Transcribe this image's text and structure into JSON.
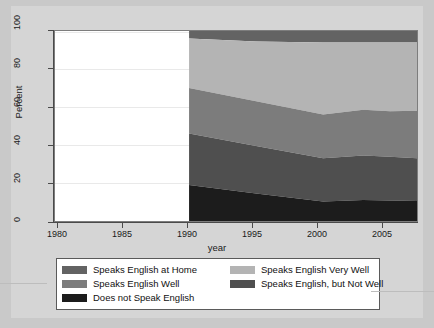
{
  "chart_data": {
    "type": "area",
    "title": "",
    "subtitle": "",
    "xlabel": "year",
    "ylabel": "Percent",
    "xlim": [
      1980,
      2007
    ],
    "ylim": [
      0,
      100
    ],
    "grid": true,
    "legend_position": "bottom",
    "stacked": true,
    "x": [
      1990,
      1995,
      2000,
      2003,
      2005,
      2007
    ],
    "xticks": [
      "1980",
      "1985",
      "1990",
      "1995",
      "2000",
      "2005"
    ],
    "xtick_values": [
      1980,
      1985,
      1990,
      1995,
      2000,
      2005
    ],
    "yticks": [
      "0",
      "20",
      "40",
      "60",
      "80",
      "100"
    ],
    "ytick_values": [
      0,
      20,
      40,
      60,
      80,
      100
    ],
    "series": [
      {
        "name": "Does not Speak English",
        "color": "#1c1c1c",
        "values": [
          19.0,
          14.5,
          10.2,
          11.0,
          10.8,
          10.5
        ]
      },
      {
        "name": "Speaks English, but Not Well",
        "color": "#4f4f4f",
        "values": [
          27.0,
          25.0,
          22.8,
          23.5,
          23.0,
          22.5
        ]
      },
      {
        "name": "Speaks English Well",
        "color": "#7c7c7c",
        "values": [
          24.0,
          23.5,
          23.0,
          24.0,
          24.0,
          25.0
        ]
      },
      {
        "name": "Speaks English Very Well",
        "color": "#b4b4b4",
        "values": [
          26.0,
          31.5,
          38.0,
          35.5,
          36.2,
          36.0
        ]
      },
      {
        "name": "Speaks English at Home",
        "color": "#636363",
        "values": [
          4.0,
          5.5,
          6.0,
          6.0,
          6.0,
          6.0
        ]
      }
    ],
    "cumulative_boundaries": {
      "1990": [
        19.0,
        46.0,
        70.0,
        96.0,
        100.0
      ],
      "1995": [
        14.5,
        39.5,
        63.0,
        94.5,
        100.0
      ],
      "2000": [
        10.2,
        33.0,
        56.0,
        94.0,
        100.0
      ],
      "2003": [
        11.0,
        34.5,
        58.5,
        94.0,
        100.0
      ],
      "2005": [
        10.8,
        33.8,
        57.8,
        94.0,
        100.0
      ],
      "2007": [
        10.5,
        33.0,
        58.0,
        94.0,
        100.0
      ]
    }
  },
  "axes": {
    "y_title": "Percent",
    "x_title": "year",
    "y_ticks": [
      "0",
      "20",
      "40",
      "60",
      "80",
      "100"
    ],
    "x_ticks": [
      "1980",
      "1985",
      "1990",
      "1995",
      "2000",
      "2005"
    ]
  },
  "legend": {
    "entries": [
      {
        "label": "Speaks English at Home",
        "color": "#636363"
      },
      {
        "label": "Speaks English Very Well",
        "color": "#b4b4b4"
      },
      {
        "label": "Speaks English Well",
        "color": "#7c7c7c"
      },
      {
        "label": "Speaks English, but Not Well",
        "color": "#4f4f4f"
      },
      {
        "label": "Does not Speak English",
        "color": "#1c1c1c"
      }
    ]
  },
  "colors": {
    "page_background": "#c9c9c9",
    "graph_background": "#d5d5d5",
    "plot_background": "#ffffff",
    "axis": "#4a4a4a",
    "gridline": "#e9e9e9"
  }
}
